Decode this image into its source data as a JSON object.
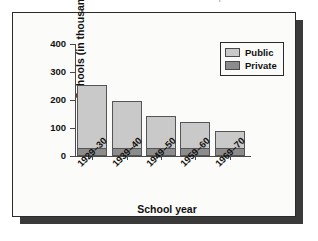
{
  "caption": {
    "sliver_text": "FIGURE 2.2",
    "sliver_text_2": "Number of Schools: Bar Graph"
  },
  "chart_data": {
    "type": "bar",
    "subtype": "stacked",
    "title": "",
    "xlabel": "School year",
    "ylabel": "Schools (in thousands)",
    "categories": [
      "1929–30",
      "1939–40",
      "1949–50",
      "1959–60",
      "1969–70"
    ],
    "series": [
      {
        "name": "Private",
        "color": "#8c8c8c",
        "values": [
          30,
          30,
          30,
          30,
          30
        ]
      },
      {
        "name": "Public",
        "color": "#c9c9c9",
        "values": [
          225,
          165,
          112,
          92,
          60
        ]
      }
    ],
    "totals": [
      255,
      195,
      142,
      122,
      90
    ],
    "ylim": [
      0,
      400
    ],
    "yticks": [
      0,
      100,
      200,
      300,
      400
    ],
    "ytick_labels": [
      "0",
      "100",
      "200",
      "300",
      "400"
    ],
    "grid": false,
    "legend_position": "top-right",
    "legend": [
      "Public",
      "Private"
    ]
  },
  "legend": {
    "items": [
      {
        "label": "Public",
        "swatch": "public"
      },
      {
        "label": "Private",
        "swatch": "private"
      }
    ]
  },
  "colors": {
    "public": "#c9c9c9",
    "private": "#8c8c8c",
    "panel_border": "#2a2a2a",
    "panel_bg": "#fbfbfa",
    "shadow": "#3a3a3a",
    "axis": "#4a4a4a",
    "text": "#111111"
  }
}
